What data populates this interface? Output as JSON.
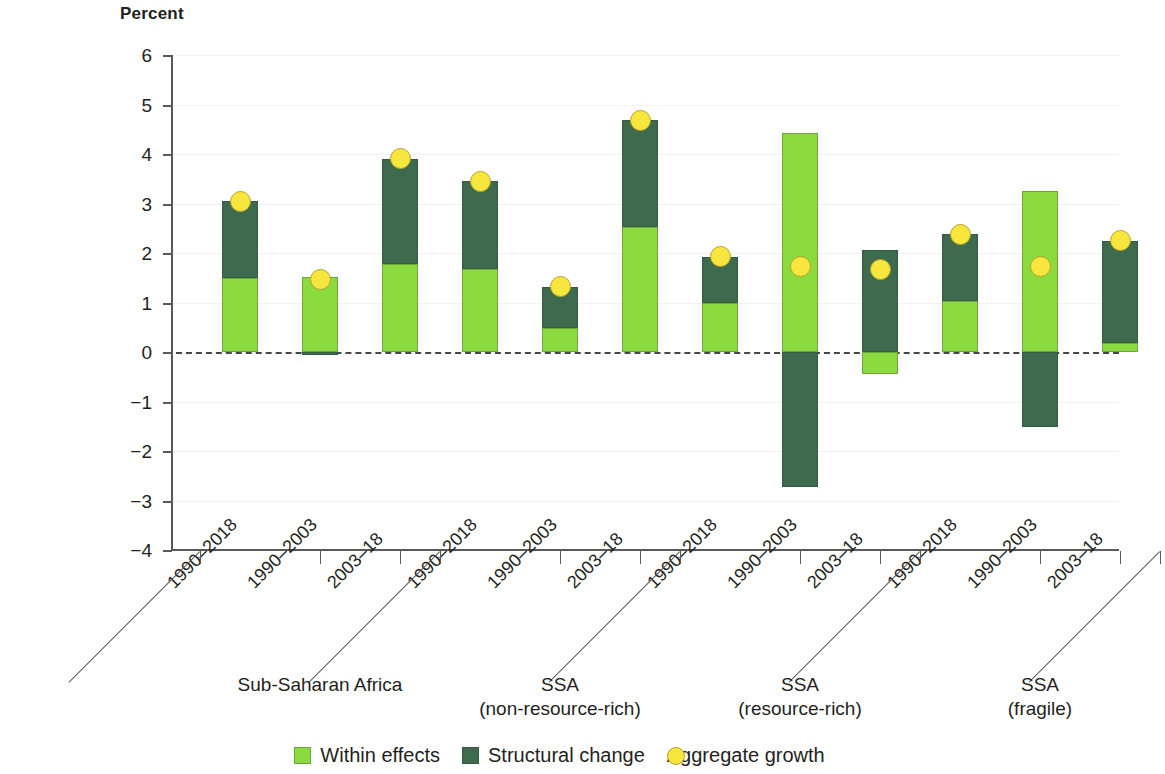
{
  "chart_data": {
    "type": "bar",
    "title": "",
    "ylabel": "Percent",
    "xlabel": "",
    "ylim": [
      -4,
      6
    ],
    "yticks": [
      6,
      5,
      4,
      3,
      2,
      1,
      0,
      -1,
      -2,
      -3,
      -4
    ],
    "ytick_labels": [
      "6",
      "5",
      "4",
      "3",
      "2",
      "1",
      "0",
      "−1",
      "−2",
      "−3",
      "−4"
    ],
    "grid": true,
    "stacked": true,
    "legend_position": "bottom",
    "categories": [
      "1990–2018",
      "1990–2003",
      "2003–18",
      "1990–2018",
      "1990–2003",
      "2003–18",
      "1990–2018",
      "1990–2003",
      "2003–18",
      "1990–2018",
      "1990–2003",
      "2003–18"
    ],
    "groups": [
      {
        "label": "Sub-Saharan Africa",
        "span": 3
      },
      {
        "label": "SSA\n(non-resource-rich)",
        "span": 3
      },
      {
        "label": "SSA\n(resource-rich)",
        "span": 3
      },
      {
        "label": "SSA\n(fragile)",
        "span": 3
      }
    ],
    "series": [
      {
        "name": "Within effects",
        "color": "#8ada40",
        "values": [
          1.5,
          1.52,
          1.78,
          1.68,
          0.48,
          2.52,
          0.98,
          4.43,
          -0.45,
          1.04,
          3.25,
          0.18
        ]
      },
      {
        "name": "Structural change",
        "color": "#3e6b4d",
        "values": [
          1.55,
          -0.07,
          2.12,
          1.77,
          0.84,
          2.16,
          0.94,
          -2.72,
          2.07,
          1.34,
          -1.52,
          2.07
        ]
      },
      {
        "name": "Aggregate growth",
        "color": "#f6e63d",
        "marker": "circle",
        "values": [
          3.05,
          1.47,
          3.9,
          3.45,
          1.32,
          4.68,
          1.92,
          1.73,
          1.66,
          2.38,
          1.73,
          2.25
        ]
      }
    ]
  },
  "legend": {
    "items": [
      {
        "label": "Within effects",
        "icon": "square-swatch-icon"
      },
      {
        "label": "Structural change",
        "icon": "square-swatch-icon"
      },
      {
        "label": "Aggregate growth",
        "icon": "circle-marker-icon"
      }
    ]
  },
  "colors": {
    "within": "#8ada40",
    "structural": "#3e6b4d",
    "aggregate": "#f6e63d",
    "axis": "#58595b",
    "grid": "#f2f2f4",
    "text": "#231f20"
  }
}
